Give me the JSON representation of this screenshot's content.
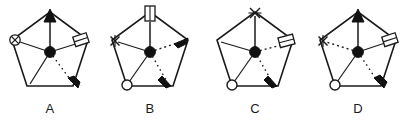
{
  "figure": {
    "type": "diagram",
    "panel_count": 4,
    "geometry": {
      "pentagon_vertices_names": [
        "top",
        "right",
        "bottom-right",
        "bottom-left",
        "left"
      ],
      "center_marker": "filled-disc",
      "spoke_count": 5
    },
    "colors": {
      "stroke": "#1a1a1a",
      "fill_solid": "#111111",
      "fill_hollow": "#ffffff",
      "background": "#ffffff",
      "label_text": "#1a1a1a"
    }
  },
  "panels": [
    {
      "id": "A",
      "label": "A",
      "markers": {
        "top": "filled-arrowhead-up",
        "right": "open-rectangle",
        "left": "circled-x",
        "bottom_left": "none",
        "bottom_right": "filled-arrowhead-dashed"
      },
      "spokes": [
        {
          "to": "top",
          "style": "solid",
          "head": "filled-arrowhead"
        },
        {
          "to": "right",
          "style": "solid",
          "head": "open-rectangle"
        },
        {
          "to": "left",
          "style": "solid",
          "head": "circled-x"
        },
        {
          "to": "bottom-left",
          "style": "solid",
          "head": "none"
        },
        {
          "to": "bottom-right",
          "style": "dashed",
          "head": "filled-arrowhead"
        }
      ]
    },
    {
      "id": "B",
      "label": "B",
      "markers": {
        "top": "open-rectangle",
        "right": "filled-arrowhead-up-right",
        "left": "x-mark",
        "bottom_left": "open-circle",
        "bottom_right": "filled-arrowhead-dashed-short"
      },
      "spokes": [
        {
          "to": "top",
          "style": "solid",
          "head": "open-rectangle"
        },
        {
          "to": "right",
          "style": "dashed",
          "head": "filled-arrowhead"
        },
        {
          "to": "left",
          "style": "solid",
          "head": "x-mark"
        },
        {
          "to": "bottom-left",
          "style": "solid",
          "head": "open-circle"
        },
        {
          "to": "bottom-right",
          "style": "dashed",
          "head": "filled-arrowhead"
        }
      ]
    },
    {
      "id": "C",
      "label": "C",
      "markers": {
        "top": "x-mark",
        "right": "open-rectangle",
        "left": "none",
        "bottom_left": "open-circle",
        "bottom_right": "filled-arrowhead-dashed-short"
      },
      "spokes": [
        {
          "to": "top",
          "style": "solid",
          "head": "x-mark"
        },
        {
          "to": "right",
          "style": "dashed",
          "head": "open-rectangle"
        },
        {
          "to": "left",
          "style": "solid",
          "head": "none"
        },
        {
          "to": "bottom-left",
          "style": "solid",
          "head": "open-circle"
        },
        {
          "to": "bottom-right",
          "style": "dashed",
          "head": "filled-arrowhead"
        }
      ]
    },
    {
      "id": "D",
      "label": "D",
      "markers": {
        "top": "filled-arrowhead-up",
        "right": "open-rectangle",
        "left": "x-mark",
        "bottom_left": "open-circle",
        "bottom_right": "filled-arrowhead-dashed"
      },
      "spokes": [
        {
          "to": "top",
          "style": "solid",
          "head": "filled-arrowhead"
        },
        {
          "to": "right",
          "style": "solid",
          "head": "open-rectangle"
        },
        {
          "to": "left",
          "style": "dashed",
          "head": "x-mark"
        },
        {
          "to": "bottom-left",
          "style": "solid",
          "head": "open-circle"
        },
        {
          "to": "bottom-right",
          "style": "dashed",
          "head": "filled-arrowhead"
        }
      ]
    }
  ]
}
